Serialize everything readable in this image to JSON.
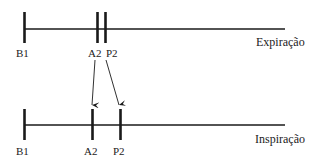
{
  "diagram": {
    "type": "timeline-comparison",
    "colors": {
      "line": "#1a1a1a",
      "background": "#ffffff"
    },
    "rows": [
      {
        "title": "Expiração",
        "markers": [
          {
            "label": "B1",
            "x": 24
          },
          {
            "label": "A2",
            "x": 97
          },
          {
            "label": "P2",
            "x": 105
          }
        ]
      },
      {
        "title": "Inspiração",
        "markers": [
          {
            "label": "B1",
            "x": 24
          },
          {
            "label": "A2",
            "x": 92
          },
          {
            "label": "P2",
            "x": 120
          }
        ]
      }
    ],
    "arrows": [
      {
        "from": "A2 (Expiração)",
        "to": "A2 (Inspiração)"
      },
      {
        "from": "P2 (Expiração)",
        "to": "P2 (Inspiração)"
      }
    ]
  }
}
